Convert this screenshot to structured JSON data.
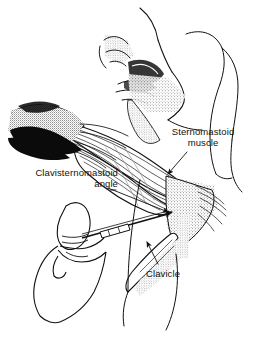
{
  "figure": {
    "kind": "anatomical-line-illustration",
    "background_color": "#ffffff",
    "ink_color": "#111111",
    "width": 267,
    "height": 340
  },
  "labels": [
    {
      "id": "sternomastoid-muscle",
      "text": "Sternomastoid\nmuscle",
      "align": "center",
      "x": 155,
      "y": 126,
      "width": 96,
      "leader": {
        "from_x": 187,
        "from_y": 152,
        "to_x": 166,
        "to_y": 176,
        "arrow": true
      }
    },
    {
      "id": "clavisternomastoid-angle",
      "text": "Clavisternomastoid\nangle",
      "align": "right",
      "x": 6,
      "y": 167,
      "width": 112,
      "leader": {
        "from_x": 110,
        "from_y": 188,
        "to_x": 170,
        "to_y": 214,
        "arrow": true
      }
    },
    {
      "id": "clavicle",
      "text": "Clavicle",
      "align": "left",
      "x": 146,
      "y": 268,
      "width": 46,
      "leader": {
        "from_x": 158,
        "from_y": 266,
        "to_x": 146,
        "to_y": 240,
        "arrow": true
      }
    }
  ],
  "regions": {
    "face_profile": "nose, eye, lips and chin rendered in stipple and fine contour at upper centre",
    "jaw_and_ear_contour": "thin open curves at upper right forming jawline, ear and neck edge",
    "sternomastoid_belly": "banded striations running from upper right down to left across the neck",
    "retracted_tissue": "solid black and stippled mass at left edge representing reflected skin flap",
    "supraclavicular_fossa": "dense stipple wedge below the muscle insertion",
    "clavicle_bone": "elongated stippled bone running down and left below the fossa",
    "hand": "index finger and thumb of a hand at lower left gripping the needle",
    "needle": "slender shafted needle with hub, angled up to the right toward the angle"
  }
}
